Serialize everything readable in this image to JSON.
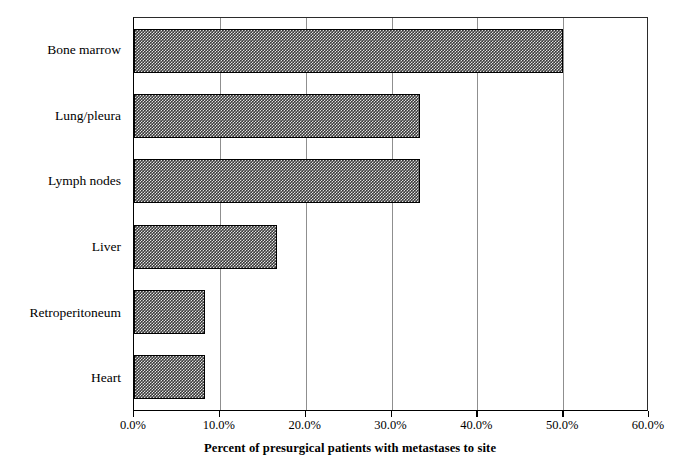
{
  "chart_data": {
    "type": "bar",
    "orientation": "horizontal",
    "title": "",
    "xlabel": "Percent of presurgical patients with metastases to site",
    "ylabel": "",
    "xlim": [
      0,
      60
    ],
    "xtick_labels": [
      "0.0%",
      "10.0%",
      "20.0%",
      "30.0%",
      "40.0%",
      "50.0%",
      "60.0%"
    ],
    "xtick_values": [
      0,
      10,
      20,
      30,
      40,
      50,
      60
    ],
    "grid": "vertical",
    "legend": "none",
    "categories": [
      "Bone marrow",
      "Lung/pleura",
      "Lymph nodes",
      "Liver",
      "Retroperitoneum",
      "Heart"
    ],
    "values": [
      50.0,
      33.3,
      33.3,
      16.7,
      8.3,
      8.3
    ],
    "series": [
      {
        "name": "Percent of presurgical patients with metastases to site",
        "values": [
          50.0,
          33.3,
          33.3,
          16.7,
          8.3,
          8.3
        ]
      }
    ],
    "bar_fill": "#3a3a3a",
    "bar_border": "#000000",
    "gridline_color": "#8f8f8f",
    "axis_color": "#000000",
    "background": "#ffffff"
  }
}
